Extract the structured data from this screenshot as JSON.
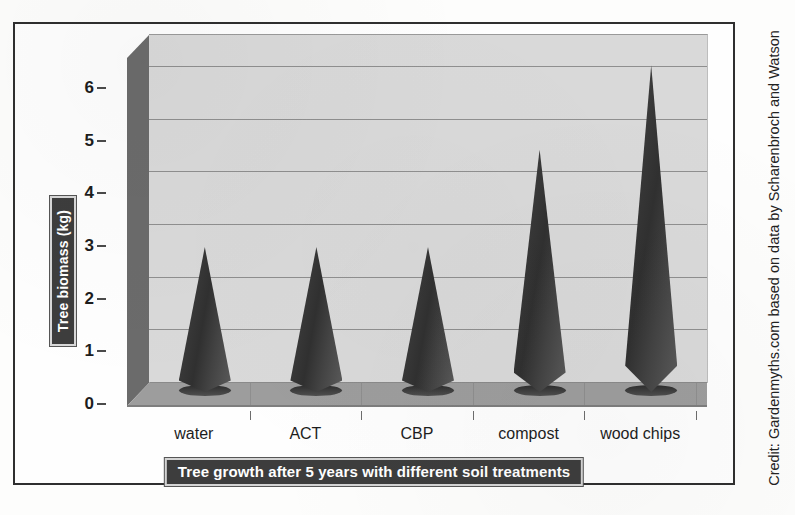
{
  "credit": "Credit: Gardenmyths.com based on data by Scharenbroch and Watson",
  "axis": {
    "y_title": "Tree biomass (kg)"
  },
  "chart_data": {
    "type": "bar",
    "title": "Tree growth after 5 years with different soil treatments",
    "xlabel": "",
    "ylabel": "Tree biomass (kg)",
    "categories": [
      "water",
      "ACT",
      "CBP",
      "compost",
      "wood chips"
    ],
    "values": [
      2.75,
      2.75,
      2.75,
      4.6,
      6.2
    ],
    "yticks": [
      0,
      1,
      2,
      3,
      4,
      5,
      6
    ],
    "ytick_labels": [
      "0",
      "1",
      "2",
      "3",
      "4",
      "5",
      "6"
    ],
    "ylim": [
      0,
      6.6
    ],
    "grid": true,
    "legend": "none",
    "style": "3d-cone",
    "series_color": "#3a3a3a",
    "plot_background": "#d9d9d9",
    "floor_color": "#9d9d9d",
    "sidewall_color": "#6b6b6b",
    "title_plaque_color": "#3d3d3d",
    "title_text_color": "#ffffff"
  }
}
